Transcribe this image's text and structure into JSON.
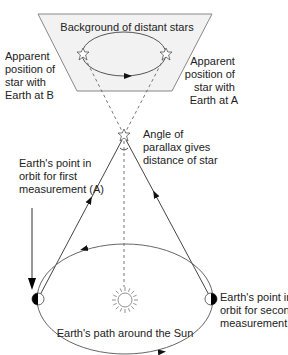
{
  "diagram": {
    "background_panel_label": "Background of distant stars",
    "labels": {
      "apparent_B": [
        "Apparent",
        "position of",
        "star with",
        "Earth at B"
      ],
      "apparent_A": [
        "Apparent",
        "position of",
        "star with",
        "Earth at A"
      ],
      "parallax_angle": [
        "Angle of",
        "parallax gives",
        "distance of star"
      ],
      "earth_A": [
        "Earth's point in",
        "orbit for first",
        "measurement (A)"
      ],
      "earth_B": [
        "Earth's point in",
        "orbit for second",
        "measurement (B)"
      ],
      "orbit": "Earth's path around the Sun"
    },
    "colors": {
      "line": "#444444",
      "panel_fill": "#f2f2f2",
      "panel_stroke": "#888888",
      "earth_dark": "#000000",
      "text": "#222222"
    },
    "icons": [
      "near-star-icon",
      "distant-star-icon",
      "sun-icon",
      "earth-icon"
    ]
  }
}
